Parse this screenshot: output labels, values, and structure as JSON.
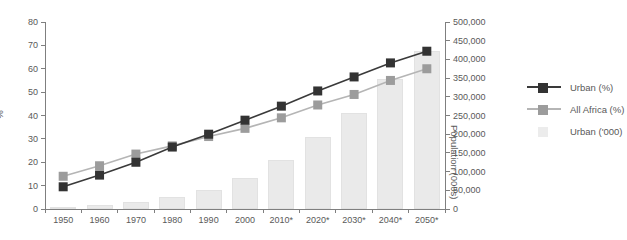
{
  "chart_data": {
    "type": "combo-bar-line",
    "title": "",
    "categories": [
      "1950",
      "1960",
      "1970",
      "1980",
      "1990",
      "2000",
      "2010*",
      "2020*",
      "2030*",
      "2040*",
      "2050*"
    ],
    "series": [
      {
        "name": "Urban (%)",
        "type": "line",
        "axis": "left",
        "line_color": "#3a3a3a",
        "marker_color": "#333333",
        "values": [
          9.5,
          14.5,
          20,
          26.5,
          32,
          38,
          44,
          50.5,
          56.5,
          62.5,
          67.5
        ]
      },
      {
        "name": "All Africa (%)",
        "type": "line",
        "axis": "left",
        "line_color": "#b5b5b5",
        "marker_color": "#9c9c9c",
        "values": [
          14,
          18.5,
          23.5,
          27,
          31,
          34.5,
          39,
          44.5,
          49,
          55,
          60
        ]
      },
      {
        "name": "Urban ('000)",
        "type": "bar",
        "axis": "right",
        "fill_color": "#eaeaea",
        "values": [
          5000,
          10000,
          19000,
          32000,
          51000,
          84000,
          132000,
          192000,
          257000,
          347000,
          423000
        ]
      }
    ],
    "left_axis": {
      "label": "%",
      "min": 0,
      "max": 80,
      "ticks": [
        "0",
        "10",
        "20",
        "30",
        "40",
        "50",
        "60",
        "70",
        "80"
      ]
    },
    "right_axis": {
      "label": "Population (000s)",
      "min": 0,
      "max": 500000,
      "ticks": [
        "0",
        "50,000",
        "100,000",
        "150,000",
        "200,000",
        "250,000",
        "300,000",
        "350,000",
        "400,000",
        "450,000",
        "500,000"
      ]
    },
    "grid": false,
    "legend_position": "right"
  },
  "colors": {
    "background": "#ffffff",
    "axis": "#7f7f7f",
    "text": "#595959",
    "urban_line": "#3a3a3a",
    "all_africa_line": "#b5b5b5",
    "bar_fill": "#eaeaea"
  }
}
